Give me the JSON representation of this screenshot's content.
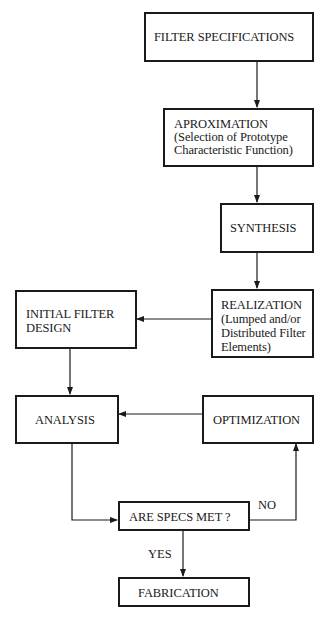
{
  "diagram": {
    "type": "flowchart",
    "nodes": {
      "filter_specifications": {
        "lines": [
          "FILTER SPECIFICATIONS"
        ]
      },
      "approximation": {
        "lines": [
          "APROXIMATION",
          "(Selection of Prototype",
          "Characteristic Function)"
        ]
      },
      "synthesis": {
        "lines": [
          "SYNTHESIS"
        ]
      },
      "realization": {
        "lines": [
          "REALIZATION",
          "(Lumped and/or",
          "Distributed Filter",
          "Elements)"
        ]
      },
      "initial_filter_design": {
        "lines": [
          "INITIAL FILTER",
          "DESIGN"
        ]
      },
      "analysis": {
        "lines": [
          "ANALYSIS"
        ]
      },
      "optimization": {
        "lines": [
          "OPTIMIZATION"
        ]
      },
      "are_specs_met": {
        "lines": [
          "ARE SPECS MET ?"
        ]
      },
      "fabrication": {
        "lines": [
          "FABRICATION"
        ]
      }
    },
    "edge_labels": {
      "no": "NO",
      "yes": "YES"
    },
    "edges": [
      {
        "from": "filter_specifications",
        "to": "approximation"
      },
      {
        "from": "approximation",
        "to": "synthesis"
      },
      {
        "from": "synthesis",
        "to": "realization"
      },
      {
        "from": "realization",
        "to": "initial_filter_design"
      },
      {
        "from": "initial_filter_design",
        "to": "analysis"
      },
      {
        "from": "optimization",
        "to": "analysis"
      },
      {
        "from": "analysis",
        "to": "are_specs_met"
      },
      {
        "from": "are_specs_met",
        "to": "optimization",
        "label": "NO"
      },
      {
        "from": "are_specs_met",
        "to": "fabrication",
        "label": "YES"
      }
    ],
    "colors": {
      "line": "#1a1a1a",
      "background": "#ffffff"
    }
  }
}
